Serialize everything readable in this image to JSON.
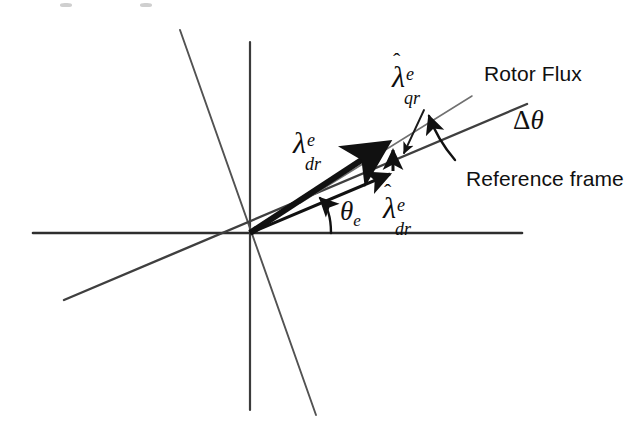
{
  "figure": {
    "background_color": "#ffffff",
    "ink_color": "#111111",
    "axis_color": "#3a3a3a",
    "thick_vector_color": "#111111"
  },
  "labels": {
    "rotor_flux": "Rotor Flux",
    "reference_frame": "Reference frame",
    "lambda_dr_e": {
      "hat": false,
      "base": "λ",
      "superscript": "e",
      "subscript": "dr"
    },
    "lambda_qr_e_hat": {
      "hat": true,
      "hat_glyph": "ˆ",
      "base": "λ",
      "superscript": "e",
      "subscript": "qr"
    },
    "lambda_dr_e_hat": {
      "hat": true,
      "hat_glyph": "ˆ",
      "base": "λ",
      "superscript": "e",
      "subscript": "dr"
    },
    "theta_e": {
      "base": "θ",
      "subscript": "e"
    },
    "delta_theta": {
      "delta": "Δ",
      "theta": "θ"
    }
  },
  "geometry": {
    "origin": {
      "x": 250,
      "y": 233
    },
    "horizontal_axis": {
      "x1": 33,
      "y1": 233,
      "x2": 522,
      "y2": 233
    },
    "vertical_axis": {
      "x1": 250,
      "y1": 42,
      "x2": 250,
      "y2": 410
    },
    "steep_diagonal": {
      "x1": 180,
      "y1": 30,
      "x2": 316,
      "y2": 415
    },
    "reference_frame_line": {
      "x1": 64,
      "y1": 300,
      "x2": 527,
      "y2": 104
    },
    "rotor_flux_line": {
      "x1": 250,
      "y1": 233,
      "x2": 470,
      "y2": 97
    },
    "thick_vector_lambda_dr": {
      "x1": 250,
      "y1": 233,
      "x2": 391,
      "y2": 141
    },
    "vector_lambda_dr_hat": {
      "x1": 250,
      "y1": 233,
      "x2": 396,
      "y2": 171
    },
    "vector_lambda_qr_hat": {
      "x1": 393,
      "y1": 170,
      "x2": 393,
      "y2": 143
    },
    "theta_e_arc": {
      "start_x": 331,
      "start_y": 233,
      "end_x": 317,
      "end_y": 196
    },
    "delta_theta_arc": {
      "start_x": 452,
      "start_y": 157,
      "end_x": 425,
      "end_y": 110
    },
    "qr_pointer": {
      "x1": 427,
      "y1": 113,
      "x2": 400,
      "y2": 158
    }
  },
  "positions": {
    "rotor_flux_label": {
      "left": 484,
      "top": 63
    },
    "reference_frame_label": {
      "left": 466,
      "top": 168
    },
    "lambda_dr_e_label": {
      "left": 293,
      "top": 128
    },
    "lambda_qr_e_hat_label": {
      "left": 392,
      "top": 62
    },
    "lambda_dr_e_hat_label": {
      "left": 383,
      "top": 193
    },
    "theta_e_label": {
      "left": 340,
      "top": 198
    },
    "delta_theta_label": {
      "left": 513,
      "top": 107
    }
  }
}
